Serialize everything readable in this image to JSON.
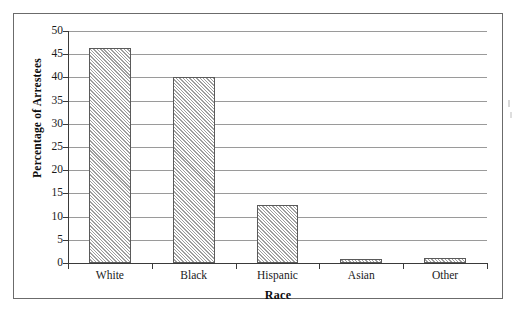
{
  "chart_data": {
    "type": "bar",
    "title": "",
    "xlabel": "Race",
    "ylabel": "Percentage of Arrestees",
    "categories": [
      "White",
      "Black",
      "Hispanic",
      "Asian",
      "Other"
    ],
    "values": [
      46.3,
      40.1,
      12.4,
      0.9,
      1.1
    ],
    "ylim": [
      0,
      50
    ],
    "yticks": [
      0,
      5,
      10,
      15,
      20,
      25,
      30,
      35,
      40,
      45,
      50
    ],
    "ytick_labels": [
      "0",
      "5",
      "10",
      "15",
      "20",
      "25",
      "30",
      "35",
      "40",
      "45",
      "50"
    ],
    "grid": true,
    "grid_axis": "y",
    "legend": false,
    "bar_fill": "diagonal-hatch",
    "bar_edge_color": "#5a5a5a",
    "grid_color": "#9a9a9a",
    "axis_color": "#3a3a3a",
    "background_color": "#ffffff"
  }
}
